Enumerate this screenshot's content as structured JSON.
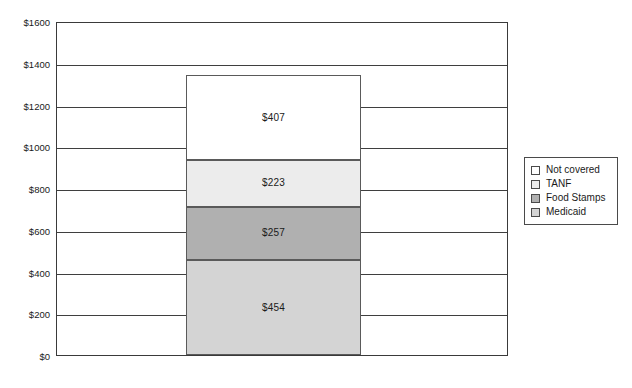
{
  "chart_data": {
    "type": "bar",
    "subtype": "stacked-bar-single-category",
    "title": "",
    "subtitle": "",
    "xlabel": "",
    "ylabel": "",
    "categories": [
      ""
    ],
    "ylim": [
      0,
      1600
    ],
    "ytick_step": 200,
    "ytick_labels": [
      "$0",
      "$200",
      "$400",
      "$600",
      "$800",
      "$1000",
      "$1200",
      "$1400",
      "$1600"
    ],
    "ytick_values": [
      0,
      200,
      400,
      600,
      800,
      1000,
      1200,
      1400,
      1600
    ],
    "grid": true,
    "grid_axis": "y",
    "legend_position": "right",
    "total": 1341,
    "series": [
      {
        "name": "Medicaid",
        "values": [
          454
        ],
        "data_label": "$454",
        "color": "#d4d4d4",
        "stack_order": 1,
        "range": [
          0,
          454
        ]
      },
      {
        "name": "Food Stamps",
        "values": [
          257
        ],
        "data_label": "$257",
        "color": "#b0b0b0",
        "stack_order": 2,
        "range": [
          454,
          711
        ]
      },
      {
        "name": "TANF",
        "values": [
          223
        ],
        "data_label": "$223",
        "color": "#ececec",
        "stack_order": 3,
        "range": [
          711,
          934
        ]
      },
      {
        "name": "Not covered",
        "values": [
          407
        ],
        "data_label": "$407",
        "color": "#ffffff",
        "stack_order": 4,
        "range": [
          934,
          1341
        ]
      }
    ]
  },
  "legend": {
    "items": [
      {
        "label": "Not covered",
        "color": "#ffffff"
      },
      {
        "label": "TANF",
        "color": "#ececec"
      },
      {
        "label": "Food Stamps",
        "color": "#b0b0b0"
      },
      {
        "label": "Medicaid",
        "color": "#d4d4d4"
      }
    ]
  },
  "axis": {
    "y_labels": [
      "$1600",
      "$1400",
      "$1200",
      "$1000",
      "$800",
      "$600",
      "$400",
      "$200",
      "$0"
    ]
  }
}
